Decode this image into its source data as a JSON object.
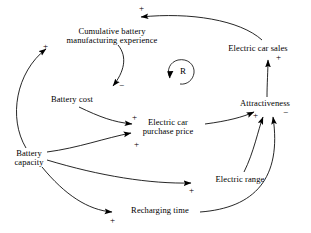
{
  "diagram": {
    "type": "causal-loop-diagram",
    "title": "",
    "loop_marker": {
      "label": "R",
      "meaning": "reinforcing",
      "x": 178,
      "y": 72
    },
    "nodes": [
      {
        "id": "cumulative-battery-manufacturing-experience",
        "label": "Cumulative battery\nmanufacturing experience",
        "line1": "Cumulative battery",
        "line2": "manufacturing experience",
        "x": 110,
        "y": 35
      },
      {
        "id": "electric-car-sales",
        "label": "Electric car sales",
        "x": 258,
        "y": 49
      },
      {
        "id": "battery-cost",
        "label": "Battery cost",
        "x": 72,
        "y": 100
      },
      {
        "id": "attractiveness",
        "label": "Attractiveness",
        "x": 265,
        "y": 105
      },
      {
        "id": "electric-car-purchase-price",
        "label": "Electric car\npurchase price",
        "line1": "Electric car",
        "line2": "purchase price",
        "x": 167,
        "y": 124
      },
      {
        "id": "battery-capacity",
        "label": "Battery\ncapacity",
        "line1": "Battery",
        "line2": "capacity",
        "x": 29,
        "y": 156
      },
      {
        "id": "electric-range",
        "label": "Electric range",
        "x": 240,
        "y": 180
      },
      {
        "id": "recharging-time",
        "label": "Recharging time",
        "x": 160,
        "y": 211
      }
    ],
    "links": [
      {
        "id": "sales-to-experience",
        "from": "electric-car-sales",
        "to": "cumulative-battery-manufacturing-experience",
        "sign": "+",
        "sign_x": 140,
        "sign_y": 9
      },
      {
        "id": "experience-to-battery-cost",
        "from": "cumulative-battery-manufacturing-experience",
        "to": "battery-cost",
        "sign": "−",
        "sign_x": 78,
        "sign_y": 84
      },
      {
        "id": "battery-cost-to-purchase-price",
        "from": "battery-cost",
        "to": "electric-car-purchase-price",
        "sign": "+",
        "sign_x": 133,
        "sign_y": 117
      },
      {
        "id": "battery-capacity-to-purchase-price",
        "from": "battery-capacity",
        "to": "electric-car-purchase-price",
        "sign": "+",
        "sign_x": 136,
        "sign_y": 147
      },
      {
        "id": "battery-capacity-to-experience",
        "from": "battery-capacity",
        "to": "cumulative-battery-manufacturing-experience",
        "sign": "+",
        "sign_x": 45,
        "sign_y": 45
      },
      {
        "id": "battery-capacity-to-electric-range",
        "from": "battery-capacity",
        "to": "electric-range",
        "sign": "+",
        "sign_x": 190,
        "sign_y": 189
      },
      {
        "id": "battery-capacity-to-recharging-time",
        "from": "battery-capacity",
        "to": "recharging-time",
        "sign": "+",
        "sign_x": 110,
        "sign_y": 219
      },
      {
        "id": "purchase-price-to-attractiveness",
        "from": "electric-car-purchase-price",
        "to": "attractiveness",
        "sign": "+",
        "sign_x": 253,
        "sign_y": 115
      },
      {
        "id": "electric-range-to-attractiveness",
        "from": "electric-range",
        "to": "attractiveness",
        "sign": "",
        "sign_x": 0,
        "sign_y": 0
      },
      {
        "id": "recharging-time-to-attractiveness",
        "from": "recharging-time",
        "to": "attractiveness",
        "sign": "−",
        "sign_x": 285,
        "sign_y": 112
      },
      {
        "id": "attractiveness-to-sales",
        "from": "attractiveness",
        "to": "electric-car-sales",
        "sign": "+",
        "sign_x": 279,
        "sign_y": 57
      }
    ],
    "colors": {
      "stroke": "#000000",
      "text": "#000000",
      "background": "#ffffff"
    }
  }
}
